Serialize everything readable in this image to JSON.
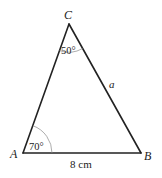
{
  "diagram": {
    "type": "triangle",
    "vertices": {
      "A": {
        "label": "A",
        "x": 23,
        "y": 153
      },
      "B": {
        "label": "B",
        "x": 141,
        "y": 153
      },
      "C": {
        "label": "C",
        "x": 69,
        "y": 24
      }
    },
    "angles": {
      "A": {
        "label": "70°"
      },
      "C": {
        "label": "50°"
      }
    },
    "sides": {
      "AB": {
        "label": "8 cm"
      },
      "BC": {
        "label": "a"
      }
    },
    "colors": {
      "stroke": "#222222",
      "arc": "#8a8a8a",
      "background": "#ffffff"
    }
  }
}
